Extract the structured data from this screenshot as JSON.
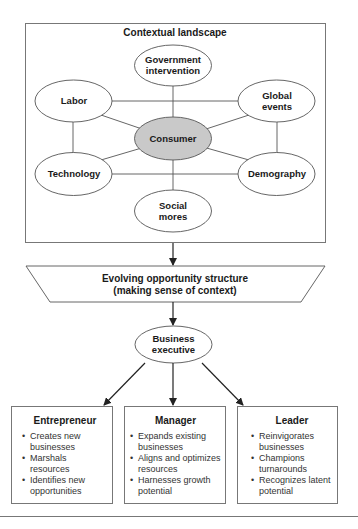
{
  "diagram": {
    "landscape": {
      "title": "Contextual landscape",
      "center": {
        "label": "Consumer",
        "fill": "#c9c9c9"
      },
      "nodes": [
        {
          "id": "government",
          "line1": "Government",
          "line2": "intervention"
        },
        {
          "id": "labor",
          "line1": "Labor",
          "line2": ""
        },
        {
          "id": "global",
          "line1": "Global",
          "line2": "events"
        },
        {
          "id": "technology",
          "line1": "Technology",
          "line2": ""
        },
        {
          "id": "demography",
          "line1": "Demography",
          "line2": ""
        },
        {
          "id": "social",
          "line1": "Social",
          "line2": "mores"
        }
      ]
    },
    "opportunity": {
      "line1": "Evolving opportunity structure",
      "line2": "(making sense of context)"
    },
    "executive": {
      "line1": "Business",
      "line2": "executive"
    },
    "roles": [
      {
        "title": "Entrepreneur",
        "bullets": [
          "Creates new businesses",
          "Marshals resources",
          "Identifies new opportunities"
        ]
      },
      {
        "title": "Manager",
        "bullets": [
          "Expands existing businesses",
          "Aligns and optimizes resources",
          "Harnesses growth potential"
        ]
      },
      {
        "title": "Leader",
        "bullets": [
          "Reinvigorates businesses",
          "Champions turnarounds",
          "Recognizes latent potential"
        ]
      }
    ],
    "colors": {
      "stroke": "#555555",
      "arrow": "#222222",
      "center_fill": "#c9c9c9"
    }
  }
}
